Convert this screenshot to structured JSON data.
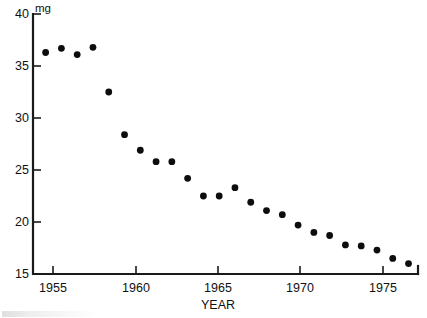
{
  "chart_data": {
    "type": "scatter",
    "title": "",
    "xlabel": "YEAR",
    "ylabel": "mg",
    "unit_label": "mg",
    "xlim": [
      1953.2,
      1977.6
    ],
    "ylim": [
      15,
      40
    ],
    "grid": false,
    "legend": "none",
    "marker": "filled-circle",
    "marker_color": "#0d0d0d",
    "x_ticks": [
      1955,
      1960,
      1965,
      1970,
      1975
    ],
    "x_tick_labels": [
      "1955",
      "1960",
      "1965",
      "1970",
      "1975"
    ],
    "y_ticks": [
      15,
      20,
      25,
      30,
      35,
      40
    ],
    "y_tick_labels": [
      "15",
      "20",
      "25",
      "30",
      "35",
      "40"
    ],
    "x": [
      1954,
      1955,
      1956,
      1957,
      1958,
      1959,
      1960,
      1961,
      1962,
      1963,
      1964,
      1965,
      1966,
      1967,
      1968,
      1969,
      1970,
      1971,
      1972,
      1973,
      1974,
      1975,
      1976,
      1977
    ],
    "values": [
      36.3,
      36.7,
      36.1,
      36.8,
      32.5,
      28.4,
      26.9,
      25.8,
      25.8,
      24.2,
      22.5,
      22.5,
      23.3,
      21.9,
      21.1,
      20.7,
      19.7,
      19.0,
      18.7,
      17.8,
      17.7,
      17.3,
      16.5,
      16.0
    ]
  },
  "axis": {
    "unit": "mg",
    "x_title": "YEAR"
  }
}
